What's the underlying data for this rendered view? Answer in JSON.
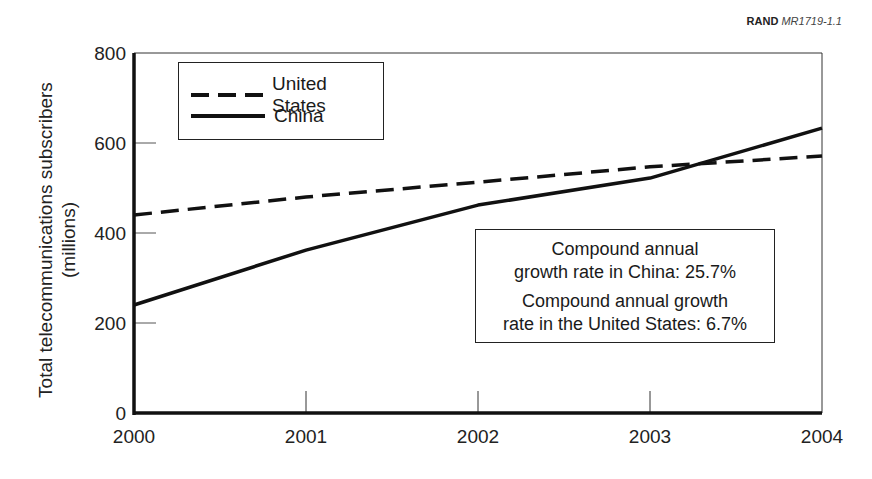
{
  "credit": {
    "org": "RAND",
    "id": "MR1719-1.1"
  },
  "chart_data": {
    "type": "line",
    "title": "",
    "xlabel": "",
    "ylabel": "Total telecommunications subscribers (millions)",
    "ylabel_line1": "Total telecommunications subscribers",
    "ylabel_line2": "(millions)",
    "x": [
      2000,
      2001,
      2002,
      2003,
      2004
    ],
    "x_tick_labels": [
      "2000",
      "2001",
      "2002",
      "2003",
      "2004"
    ],
    "y_tick_labels": [
      "0",
      "200",
      "400",
      "600",
      "800"
    ],
    "ylim": [
      0,
      800
    ],
    "grid": false,
    "legend_position": "upper left",
    "series": [
      {
        "name": "United States",
        "style": "dashed",
        "values": [
          440,
          480,
          513,
          547,
          571
        ]
      },
      {
        "name": "China",
        "style": "solid",
        "values": [
          240,
          362,
          462,
          522,
          633
        ]
      }
    ],
    "annotations": [
      {
        "line1": "Compound annual",
        "line2": "growth rate in China: 25.7%"
      },
      {
        "line1": "Compound annual growth",
        "line2": "rate in the United States: 6.7%"
      }
    ]
  },
  "legend": {
    "us_label": "United States",
    "china_label": "China"
  }
}
